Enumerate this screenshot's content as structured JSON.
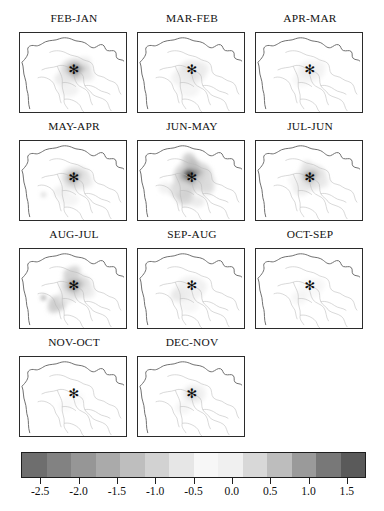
{
  "figure": {
    "type": "map-panel-grid",
    "columns": 3,
    "rows": 4,
    "panel_count": 11,
    "marker_symbol": "✻",
    "marker_name": "station-star-marker"
  },
  "chart_data": {
    "type": "heatmap",
    "title": "",
    "subtitle": "",
    "xlabel": "",
    "ylabel": "",
    "grid": false,
    "legend_position": "bottom",
    "panel_layout": {
      "rows": 4,
      "cols": 3,
      "panels_per_row": [
        3,
        3,
        3,
        2
      ]
    },
    "panels": [
      {
        "label": "FEB-JAN",
        "row": 1,
        "col": 1,
        "peak_value": -1.4,
        "signal": "moderate-negative-core"
      },
      {
        "label": "MAR-FEB",
        "row": 1,
        "col": 2,
        "peak_value": -0.6,
        "signal": "weak-negative"
      },
      {
        "label": "APR-MAR",
        "row": 1,
        "col": 3,
        "peak_value": -0.4,
        "signal": "very-weak"
      },
      {
        "label": "MAY-APR",
        "row": 2,
        "col": 1,
        "peak_value": -0.9,
        "signal": "weak-negative"
      },
      {
        "label": "JUN-MAY",
        "row": 2,
        "col": 2,
        "peak_value": -2.4,
        "signal": "strong-negative-core"
      },
      {
        "label": "JUL-JUN",
        "row": 2,
        "col": 3,
        "peak_value": -1.2,
        "signal": "moderate-negative"
      },
      {
        "label": "AUG-JUL",
        "row": 3,
        "col": 1,
        "peak_value": -1.6,
        "signal": "moderate-negative-patchy"
      },
      {
        "label": "SEP-AUG",
        "row": 3,
        "col": 2,
        "peak_value": -0.5,
        "signal": "very-weak"
      },
      {
        "label": "OCT-SEP",
        "row": 3,
        "col": 3,
        "peak_value": -0.3,
        "signal": "negligible"
      },
      {
        "label": "NOV-OCT",
        "row": 4,
        "col": 1,
        "peak_value": -0.2,
        "signal": "negligible"
      },
      {
        "label": "DEC-NOV",
        "row": 4,
        "col": 2,
        "peak_value": -0.8,
        "signal": "weak-negative"
      }
    ],
    "colorbar": {
      "orientation": "horizontal",
      "vmin": -2.75,
      "vmax": 1.75,
      "tick_values": [
        -2.5,
        -2.0,
        -1.5,
        -1.0,
        -0.5,
        0.0,
        0.5,
        1.0,
        1.5
      ],
      "tick_labels": [
        "-2.5",
        "-2.0",
        "-1.5",
        "-1.0",
        "-0.5",
        "0.0",
        "0.5",
        "1.0",
        "1.5"
      ],
      "n_bands": 14,
      "colors": [
        "#6e6e6e",
        "#828282",
        "#969696",
        "#aaaaaa",
        "#bebebe",
        "#d2d2d2",
        "#e6e6e6",
        "#f7f7f7",
        "#f0f0f0",
        "#d8d8d8",
        "#bdbdbd",
        "#9a9a9a",
        "#787878",
        "#5a5a5a"
      ]
    }
  },
  "colors": {
    "panel_border": "#2b2b2b",
    "coastline": "#6d6d6d",
    "boundary": "#b8b8b8",
    "marker": "#0a0a0a",
    "text": "#101010",
    "background": "#ffffff"
  }
}
